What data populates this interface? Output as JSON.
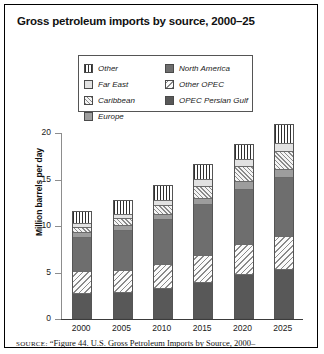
{
  "title": "Gross petroleum imports by source, 2000–25",
  "source_note": {
    "label": "SOURCE:",
    "text": " “Figure 44. U.S. Gross Petroleum Imports by Source, 2000–"
  },
  "legend": {
    "columns": [
      {
        "items": [
          {
            "label": "Other",
            "key": "other"
          },
          {
            "label": "Far East",
            "key": "fareast"
          },
          {
            "label": "Caribbean",
            "key": "caribbean"
          },
          {
            "label": "Europe",
            "key": "europe"
          }
        ]
      },
      {
        "items": [
          {
            "label": "North America",
            "key": "northamerica"
          },
          {
            "label": "Other OPEC",
            "key": "otheropec"
          },
          {
            "label": "OPEC Persian Gulf",
            "key": "persiangulf"
          }
        ]
      }
    ]
  },
  "axes": {
    "y_title": "Million barrels per day",
    "y_ticks": [
      "0",
      "5",
      "10",
      "15",
      "20"
    ],
    "x_ticks": [
      "2000",
      "2005",
      "2010",
      "2015",
      "2020",
      "2025"
    ]
  },
  "chart_data": {
    "type": "bar",
    "stacked": true,
    "title": "Gross petroleum imports by source, 2000–25",
    "xlabel": "",
    "ylabel": "Million barrels per day",
    "ylim": [
      0,
      20
    ],
    "ytick_step": 5,
    "grid": false,
    "legend_position": "top-center",
    "categories": [
      "2000",
      "2005",
      "2010",
      "2015",
      "2020",
      "2025"
    ],
    "series": [
      {
        "name": "OPEC Persian Gulf",
        "key": "persiangulf",
        "values": [
          2.6,
          2.7,
          3.1,
          3.8,
          4.6,
          5.2
        ]
      },
      {
        "name": "Other OPEC",
        "key": "otheropec",
        "values": [
          2.4,
          2.4,
          2.6,
          2.9,
          3.2,
          3.5
        ]
      },
      {
        "name": "North America",
        "key": "northamerica",
        "values": [
          3.6,
          4.3,
          4.8,
          5.4,
          6.0,
          6.4
        ]
      },
      {
        "name": "Europe",
        "key": "europe",
        "values": [
          0.5,
          0.5,
          0.6,
          0.7,
          0.8,
          0.8
        ]
      },
      {
        "name": "Caribbean",
        "key": "caribbean",
        "values": [
          0.6,
          0.7,
          0.9,
          1.3,
          1.6,
          1.9
        ]
      },
      {
        "name": "Far East",
        "key": "fareast",
        "values": [
          0.4,
          0.5,
          0.6,
          0.7,
          0.8,
          0.9
        ]
      },
      {
        "name": "Other",
        "key": "other",
        "values": [
          1.3,
          1.5,
          1.6,
          1.7,
          1.6,
          2.1
        ]
      }
    ],
    "totals": [
      11.4,
      12.6,
      14.2,
      16.5,
      18.6,
      20.8
    ]
  }
}
